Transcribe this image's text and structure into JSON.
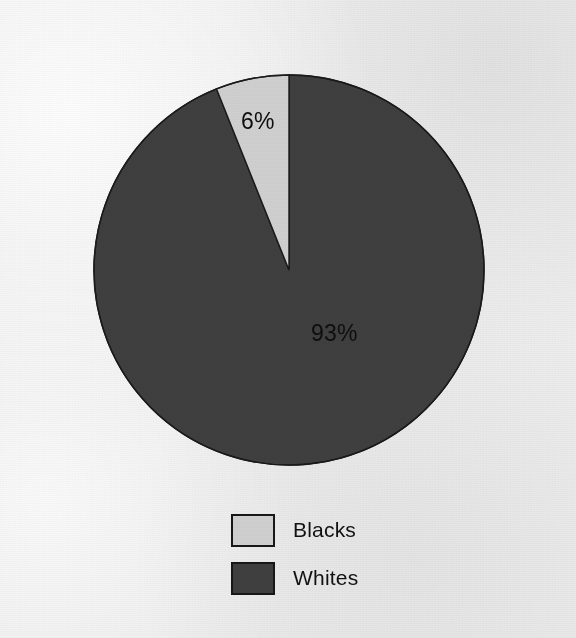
{
  "chart_data": {
    "type": "pie",
    "title": "",
    "subtitle": "",
    "xlabel": "",
    "ylabel": "",
    "grid": false,
    "legend_position": "bottom",
    "start_angle_deg": 0,
    "direction": "counterclockwise",
    "categories": [
      "Blacks",
      "Whites"
    ],
    "values": [
      6,
      93
    ],
    "value_labels": [
      "6%",
      "93%"
    ],
    "slices": [
      {
        "label": "Blacks",
        "value": 6,
        "value_label": "6%",
        "color": "#d0d0d0",
        "border_color": "#1a1a1a"
      },
      {
        "label": "Whites",
        "value": 93,
        "value_label": "93%",
        "color": "#3f3f3f",
        "border_color": "#1a1a1a"
      }
    ]
  },
  "legend": {
    "items": [
      {
        "label": "Blacks",
        "swatch_color": "#d0d0d0"
      },
      {
        "label": "Whites",
        "swatch_color": "#3f3f3f"
      }
    ]
  },
  "colors": {
    "background": "#efefef",
    "light_slice": "#d0d0d0",
    "dark_slice": "#3f3f3f",
    "outline": "#1a1a1a",
    "label_text": "#0e0e0e"
  }
}
